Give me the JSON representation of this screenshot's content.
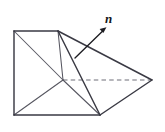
{
  "figure": {
    "type": "geometric-solid-diagram",
    "canvas": {
      "width": 165,
      "height": 132,
      "background": "#ffffff"
    },
    "colors": {
      "visible_edge": "#3a3a44",
      "thin_edge": "#565660",
      "hidden_edge": "#6e6e78",
      "vector": "#1d1d22",
      "background": "#ffffff"
    },
    "labels": {
      "normal_vector": "n"
    },
    "vertices": {
      "top_left": [
        14,
        31
      ],
      "top_mid": [
        58,
        31
      ],
      "bottom_left": [
        14,
        115
      ],
      "bottom_mid": [
        100,
        115
      ],
      "interior": [
        63,
        80
      ],
      "right_apex": [
        152,
        80
      ]
    },
    "edges": [
      {
        "name": "top-edge",
        "from": "top_left",
        "to": "top_mid",
        "style": "solid"
      },
      {
        "name": "left-edge",
        "from": "top_left",
        "to": "bottom_left",
        "style": "solid"
      },
      {
        "name": "bottom-edge",
        "from": "bottom_left",
        "to": "bottom_mid",
        "style": "solid"
      },
      {
        "name": "upper-right-slant",
        "from": "top_mid",
        "to": "right_apex",
        "style": "solid"
      },
      {
        "name": "lower-right-slant",
        "from": "bottom_mid",
        "to": "right_apex",
        "style": "solid"
      },
      {
        "name": "front-ridge",
        "from": "top_mid",
        "to": "bottom_mid",
        "style": "solid"
      },
      {
        "name": "upper-diagonal",
        "from": "top_left",
        "to": "interior",
        "style": "thin"
      },
      {
        "name": "lower-diagonal",
        "from": "bottom_left",
        "to": "interior",
        "style": "thin"
      },
      {
        "name": "interior-to-top-mid",
        "from": "interior",
        "to": "top_mid",
        "style": "thin"
      },
      {
        "name": "interior-to-bottom-mid",
        "from": "interior",
        "to": "bottom_mid",
        "style": "thin"
      },
      {
        "name": "hidden-axis",
        "from": "interior",
        "to": "right_apex",
        "style": "dashed"
      }
    ],
    "normal_vector": {
      "tail": [
        75,
        58
      ],
      "tip": [
        106,
        28
      ],
      "label": "n",
      "label_position": [
        105,
        12
      ]
    }
  }
}
